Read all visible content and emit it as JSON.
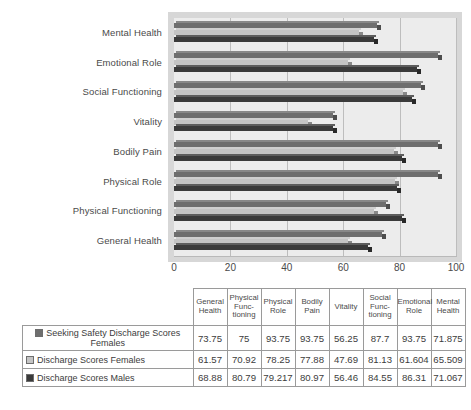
{
  "chart_data": {
    "type": "bar",
    "orientation": "horizontal",
    "title": "",
    "xlabel": "",
    "ylabel": "",
    "xlim": [
      0,
      100
    ],
    "xticks": [
      "0",
      "20",
      "40",
      "60",
      "80",
      "100"
    ],
    "grid": true,
    "legend_position": "table-row-labels",
    "categories": [
      "Mental Health",
      "Emotional Role",
      "Social Functioning",
      "Vitality",
      "Bodily Pain",
      "Physical Role",
      "Physical Functioning",
      "General Health"
    ],
    "series": [
      {
        "name": "Seeking Safety Discharge Scores Females",
        "color": "#6e6e6e",
        "values": [
          71.875,
          93.75,
          87.7,
          56.25,
          93.75,
          93.75,
          75,
          73.75
        ]
      },
      {
        "name": "Discharge Scores Females",
        "color": "#c4c4c4",
        "values": [
          65.509,
          61.604,
          81.13,
          47.69,
          77.88,
          78.25,
          70.92,
          61.57
        ]
      },
      {
        "name": "Discharge Scores Males",
        "color": "#3a3a3a",
        "values": [
          71.067,
          86.31,
          84.55,
          56.46,
          80.97,
          79.217,
          80.79,
          68.88
        ]
      }
    ]
  },
  "table": {
    "corner_label": "",
    "columns": [
      "General Health",
      "Physical Func-tioning",
      "Physical Role",
      "Bodily Pain",
      "Vitality",
      "Social Func-tioning",
      "Emotional Role",
      "Mental Health"
    ],
    "column_lines": [
      [
        "General",
        "Health"
      ],
      [
        "Physical",
        "Func-",
        "tioning"
      ],
      [
        "Physical",
        "Role"
      ],
      [
        "Bodily",
        "Pain"
      ],
      [
        "Vitality"
      ],
      [
        "Social",
        "Func-",
        "tioning"
      ],
      [
        "Emotional",
        "Role"
      ],
      [
        "Mental",
        "Health"
      ]
    ],
    "rows": [
      {
        "label": "Seeking Safety Discharge Scores Females",
        "label_lines": [
          "Seeking Safety Discharge Scores",
          "Females"
        ],
        "swatch_color": "#6e6e6e",
        "values": [
          "73.75",
          "75",
          "93.75",
          "93.75",
          "56.25",
          "87.7",
          "93.75",
          "71.875"
        ]
      },
      {
        "label": "Discharge Scores Females",
        "label_lines": [
          "Discharge Scores Females"
        ],
        "swatch_color": "#c4c4c4",
        "values": [
          "61.57",
          "70.92",
          "78.25",
          "77.88",
          "47.69",
          "81.13",
          "61.604",
          "65.509"
        ]
      },
      {
        "label": "Discharge Scores Males",
        "label_lines": [
          "Discharge Scores Males"
        ],
        "swatch_color": "#3a3a3a",
        "values": [
          "68.88",
          "80.79",
          "79.217",
          "80.97",
          "56.46",
          "84.55",
          "86.31",
          "71.067"
        ]
      }
    ]
  },
  "colors": {
    "series1": "#6e6e6e",
    "series2": "#c4c4c4",
    "series3": "#3a3a3a",
    "plot_background": "#ececec",
    "plot_depth": "#d7d7d7",
    "gridline": "#bdbdbd",
    "text": "#3c3c3c"
  }
}
